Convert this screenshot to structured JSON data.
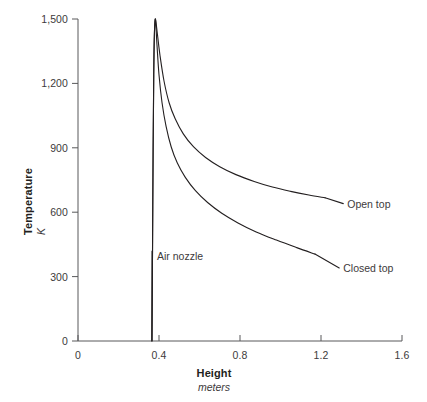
{
  "chart_data": {
    "type": "line",
    "title": "",
    "xlabel": "Height",
    "xlabel_units": "meters",
    "ylabel": "Temperature",
    "ylabel_units": "K",
    "xlim": [
      0,
      1.6
    ],
    "ylim": [
      0,
      1500
    ],
    "grid": false,
    "legend_position": "inline-right-end-labels",
    "x_ticks": [
      "0",
      "0.4",
      "0.8",
      "1.2",
      "1.6"
    ],
    "x_tick_values": [
      0,
      0.4,
      0.8,
      1.2,
      1.6
    ],
    "y_ticks": [
      "0",
      "300",
      "600",
      "900",
      "1,200",
      "1,500"
    ],
    "y_tick_values": [
      0,
      300,
      600,
      900,
      1200,
      1500
    ],
    "series": [
      {
        "name": "Open top",
        "label": "Open top",
        "color": "#231f20",
        "points": [
          [
            0.365,
            0
          ],
          [
            0.368,
            420
          ],
          [
            0.371,
            900
          ],
          [
            0.374,
            1240
          ],
          [
            0.377,
            1420
          ],
          [
            0.382,
            1500
          ],
          [
            0.392,
            1430
          ],
          [
            0.405,
            1330
          ],
          [
            0.425,
            1210
          ],
          [
            0.45,
            1110
          ],
          [
            0.48,
            1035
          ],
          [
            0.52,
            965
          ],
          [
            0.57,
            905
          ],
          [
            0.63,
            855
          ],
          [
            0.7,
            812
          ],
          [
            0.78,
            775
          ],
          [
            0.87,
            743
          ],
          [
            0.96,
            717
          ],
          [
            1.05,
            697
          ],
          [
            1.14,
            680
          ],
          [
            1.22,
            667
          ]
        ]
      },
      {
        "name": "Closed top",
        "label": "Closed top",
        "color": "#231f20",
        "points": [
          [
            0.365,
            0
          ],
          [
            0.368,
            420
          ],
          [
            0.371,
            900
          ],
          [
            0.374,
            1240
          ],
          [
            0.377,
            1420
          ],
          [
            0.382,
            1500
          ],
          [
            0.39,
            1380
          ],
          [
            0.4,
            1240
          ],
          [
            0.415,
            1110
          ],
          [
            0.435,
            1000
          ],
          [
            0.46,
            905
          ],
          [
            0.49,
            830
          ],
          [
            0.53,
            762
          ],
          [
            0.58,
            700
          ],
          [
            0.64,
            645
          ],
          [
            0.71,
            595
          ],
          [
            0.79,
            550
          ],
          [
            0.88,
            508
          ],
          [
            0.98,
            470
          ],
          [
            1.08,
            435
          ],
          [
            1.17,
            405
          ]
        ]
      }
    ],
    "annotations": [
      {
        "name": "air-nozzle",
        "label": "Air nozzle",
        "x": 0.365,
        "y_bottom": 0,
        "y_top": 420
      }
    ],
    "series_label_positions": [
      {
        "label": "Open top",
        "x": 1.31,
        "y": 640
      },
      {
        "label": "Closed top",
        "x": 1.29,
        "y": 340
      }
    ],
    "colors": {
      "axis": "#58595b",
      "line": "#231f20",
      "text": "#231f20",
      "tick_text": "#3d3a3b",
      "background": "#ffffff"
    }
  }
}
